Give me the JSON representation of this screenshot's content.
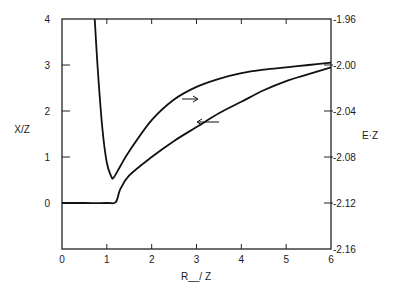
{
  "chart_data": {
    "type": "line",
    "title": "",
    "xlabel": "R__/ Z",
    "ylabel_left": "X/Z",
    "ylabel_right": "E·Z",
    "xlim": [
      0,
      6
    ],
    "ylim_left": [
      -1,
      4
    ],
    "ylim_right": [
      -2.16,
      -1.96
    ],
    "x_ticks": [
      "0",
      "1",
      "2",
      "3",
      "4",
      "5",
      "6"
    ],
    "y_ticks_left": [
      "0",
      "1",
      "2",
      "3",
      "4"
    ],
    "y_ticks_right": [
      "-1.96",
      "-2.00",
      "-2.04",
      "-2.08",
      "-2.12",
      "-2.16"
    ],
    "grid": false,
    "legend": "none (arrows indicate axis association)",
    "series": [
      {
        "name": "E·Z",
        "axis": "right",
        "annotation": "arrow pointing right",
        "x": [
          0.73,
          0.8,
          0.9,
          1.0,
          1.1,
          1.15,
          1.3,
          1.5,
          2.0,
          2.5,
          3.0,
          3.5,
          4.0,
          4.5,
          5.0,
          5.5,
          6.0
        ],
        "values": [
          -1.96,
          -2.005,
          -2.055,
          -2.085,
          -2.097,
          -2.098,
          -2.088,
          -2.075,
          -2.048,
          -2.03,
          -2.019,
          -2.012,
          -2.007,
          -2.004,
          -2.002,
          -2.0,
          -1.998
        ]
      },
      {
        "name": "X/Z",
        "axis": "left",
        "annotation": "arrow pointing left",
        "x": [
          0.0,
          0.5,
          1.0,
          1.2,
          1.3,
          1.5,
          2.0,
          2.5,
          3.0,
          3.5,
          4.0,
          4.5,
          5.0,
          5.5,
          6.0
        ],
        "values": [
          0.0,
          0.0,
          0.0,
          0.02,
          0.3,
          0.6,
          1.0,
          1.35,
          1.65,
          1.95,
          2.2,
          2.45,
          2.65,
          2.8,
          2.95
        ]
      }
    ]
  }
}
